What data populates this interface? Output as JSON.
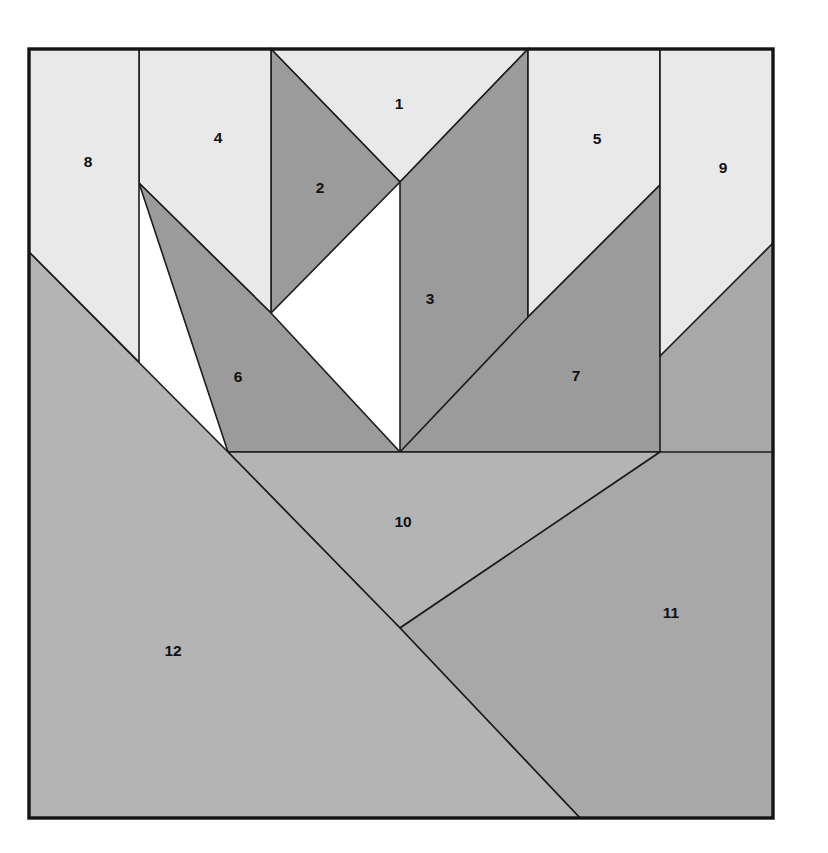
{
  "figure": {
    "canvas": {
      "width": 828,
      "height": 853
    },
    "background_color": "#ffffff",
    "frame": {
      "x": 29,
      "y": 49,
      "width": 744,
      "height": 769,
      "stroke_color": "#141414"
    },
    "palette": {
      "light": "#e9e9e9",
      "medium_light": "#b4b4b4",
      "medium": "#a8a8a8",
      "dark": "#9b9b9b",
      "outline": "#1d1d1d",
      "label": "#111111"
    },
    "regions": [
      {
        "label": "1",
        "tone": "light",
        "fill": "#e9e9e9",
        "points": "271,49 528,49 400,182",
        "label_x": 399,
        "label_y": 105
      },
      {
        "label": "2",
        "tone": "dark",
        "fill": "#9b9b9b",
        "points": "271,49 400,182 271,313",
        "label_x": 320,
        "label_y": 189
      },
      {
        "label": "3",
        "tone": "dark",
        "fill": "#9b9b9b",
        "points": "528,49 528,452 400,452 400,182",
        "label_x": 430,
        "label_y": 300
      },
      {
        "label": "4",
        "tone": "light",
        "fill": "#e9e9e9",
        "points": "139,49 271,49 271,313 139,183",
        "label_x": 218,
        "label_y": 139
      },
      {
        "label": "5",
        "tone": "light",
        "fill": "#e9e9e9",
        "points": "528,49 660,49 660,185 528,317",
        "label_x": 597,
        "label_y": 140
      },
      {
        "label": "6",
        "tone": "dark",
        "fill": "#9b9b9b",
        "points": "139,183 271,313 400,452 228,452",
        "label_x": 238,
        "label_y": 378
      },
      {
        "label": "7",
        "tone": "dark",
        "fill": "#9b9b9b",
        "points": "660,185 660,452 400,452 528,317",
        "label_x": 576,
        "label_y": 377
      },
      {
        "label": "8",
        "tone": "light",
        "fill": "#e9e9e9",
        "points": "29,49 139,49 139,362 29,252",
        "label_x": 88,
        "label_y": 163
      },
      {
        "label": "9",
        "tone": "light",
        "fill": "#e9e9e9",
        "points": "660,49 773,49 773,243 660,356",
        "label_x": 723,
        "label_y": 169
      },
      {
        "label": "10",
        "tone": "medium_light",
        "fill": "#b4b4b4",
        "points": "228,452 400,452 660,452 400,628",
        "label_x": 403,
        "label_y": 523
      },
      {
        "label": "11",
        "tone": "medium",
        "fill": "#a8a8a8",
        "points": "660,452 773,452 773,818 580,818 400,628",
        "label_x": 671,
        "label_y": 614
      },
      {
        "label": "12",
        "tone": "medium_light",
        "fill": "#b4b4b4",
        "points": "29,252 228,452 400,628 580,818 29,818",
        "label_x": 173,
        "label_y": 652
      }
    ],
    "overlay_strips": [
      {
        "name": "right-upper-dark-wedge",
        "fill": "#a8a8a8",
        "points": "660,356 773,243 773,452 660,452"
      },
      {
        "name": "left-upper-light-wedge",
        "fill": "#b4b4b4",
        "points": "29,252 139,362 139,452 228,452"
      }
    ]
  }
}
